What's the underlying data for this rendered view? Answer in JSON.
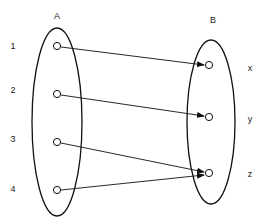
{
  "diagram": {
    "type": "set-mapping",
    "sets": [
      {
        "id": "A",
        "label": "A",
        "elements": [
          "1",
          "2",
          "3",
          "4"
        ]
      },
      {
        "id": "B",
        "label": "B",
        "elements": [
          "x",
          "y",
          "z"
        ]
      }
    ],
    "mappings": [
      {
        "from": "1",
        "to": "x"
      },
      {
        "from": "2",
        "to": "y"
      },
      {
        "from": "3",
        "to": "z"
      },
      {
        "from": "4",
        "to": "z"
      }
    ],
    "colors": {
      "stroke": "#111111",
      "text": "#222222",
      "background": "#ffffff"
    }
  }
}
